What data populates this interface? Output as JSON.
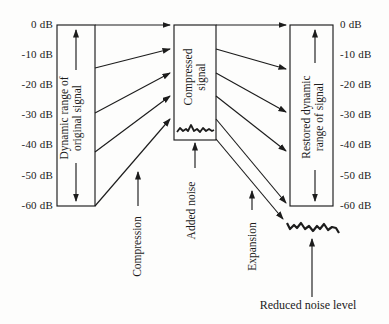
{
  "figure": {
    "colors": {
      "ink": "#1c1c1c",
      "background": "#fdfdfc"
    },
    "left_axis_labels": [
      "0 dB",
      "-10 dB",
      "-20 dB",
      "-30 dB",
      "-40 dB",
      "-50 dB",
      "-60 dB"
    ],
    "right_axis_labels": [
      "0 dB",
      "-10 dB",
      "-20 dB",
      "-30 dB",
      "-40 dB",
      "-50 dB",
      "-60 dB"
    ],
    "left_box": {
      "line1": "Dynamic range of",
      "line2": "original signal"
    },
    "middle_box": {
      "line1": "Compressed",
      "line2": "signal"
    },
    "right_box": {
      "line1": "Restored dynamic",
      "line2": "range of signal"
    },
    "captions": {
      "compression": "Compression",
      "added_noise": "Added noise",
      "expansion": "Expansion",
      "reduced_noise_level": "Reduced noise level"
    }
  }
}
